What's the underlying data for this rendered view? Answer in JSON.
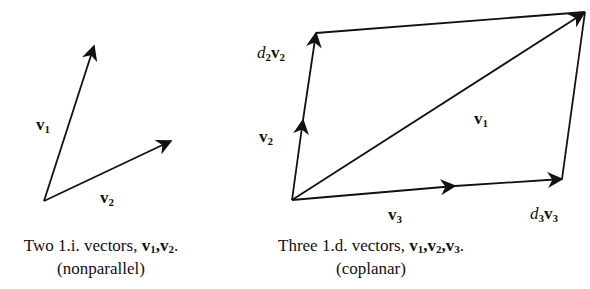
{
  "left_figure": {
    "labels": {
      "v1": "v",
      "v1_sub": "1",
      "v2": "v",
      "v2_sub": "2"
    },
    "caption_line1": "Two 1.i. vectors, ",
    "caption_vecs": [
      "v",
      "1",
      ",",
      "v",
      "2",
      "."
    ],
    "caption_line2": "(nonparallel)"
  },
  "right_figure": {
    "labels": {
      "d2v2_d": "d",
      "d2v2_dsub": "2",
      "d2v2_v": "v",
      "d2v2_vsub": "2",
      "v2": "v",
      "v2_sub": "2",
      "v1": "v",
      "v1_sub": "1",
      "v3": "v",
      "v3_sub": "3",
      "d3v3_d": "d",
      "d3v3_dsub": "3",
      "d3v3_v": "v",
      "d3v3_vsub": "3"
    },
    "caption_line1": "Three 1.d. vectors, ",
    "caption_vecs": [
      "v",
      "1",
      ",",
      "v",
      "2",
      ",",
      "v",
      "3",
      "."
    ],
    "caption_line2": "(coplanar)"
  },
  "colors": {
    "ink": "#111111",
    "background": "#ffffff"
  }
}
